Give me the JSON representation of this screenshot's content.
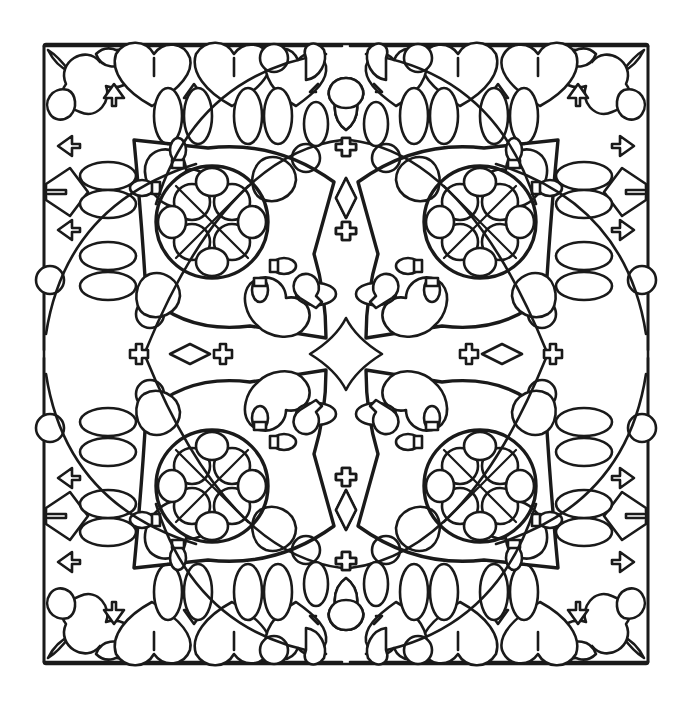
{
  "canvas": {
    "width": 695,
    "height": 708,
    "background": "#ffffff"
  },
  "artwork": {
    "line_color": "#1a1a1a",
    "fill_color": "#ffffff",
    "center": {
      "x": 346,
      "y": 354
    },
    "frame": {
      "left": 44,
      "top": 44,
      "right": 648,
      "bottom": 664
    },
    "symmetry": "4-fold (mirror across both axes)",
    "motifs": {
      "corner_rosettes": 4,
      "knot_medallions": 4,
      "center_star": 1,
      "cross_plus_marks": 8,
      "spade_marks_on_edges": 16,
      "corner_leaf_tips": 4
    }
  }
}
